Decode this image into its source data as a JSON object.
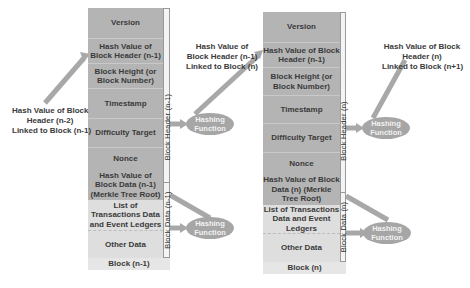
{
  "blocks": [
    {
      "id": "n-1",
      "label": "Block (n-1)",
      "header_strip_label": "Block Header (n-1)",
      "data_strip_label": "Block Data (n-1)",
      "header_fields": [
        "Version",
        "Hash Value of Block Header (n-1)",
        "Block Height (or Block Number)",
        "Timestamp",
        "Difficulty Target",
        "Nonce",
        "Hash Value of Block Data (n-1) (Merkle Tree Root)"
      ],
      "data_fields": [
        "List of Transactions Data and Event Ledgers",
        "Other Data"
      ]
    },
    {
      "id": "n",
      "label": "Block (n)",
      "header_strip_label": "Block Header (n)",
      "data_strip_label": "Block Data (n)",
      "header_fields": [
        "Version",
        "Hash Value of Block Header (n-1)",
        "Block Height (or Block Number)",
        "Timestamp",
        "Difficulty Target",
        "Nonce",
        "Hash Value of Block Data (n) (Merkle Tree Root)"
      ],
      "data_fields": [
        "List of Transactions Data and Event Ledgers",
        "Other Data"
      ]
    }
  ],
  "notes": {
    "prev_link": [
      "Hash Value of Block",
      "Header (n-2)",
      "Linked to Block (n-1)"
    ],
    "mid_link": [
      "Hash Value of",
      "Block Header (n-1)",
      "Linked to Block (n)"
    ],
    "next_link": [
      "Hash Value of Block",
      "Header (n)",
      "Linked to Block (n+1)"
    ]
  },
  "hashing_function": [
    "Hashing",
    "Function"
  ],
  "colors": {
    "header_fill": "#b4b4b4",
    "data_fill": "#dedede",
    "arrow": "#a8a8a8",
    "hash_fn_fill": "#a6a6a6"
  }
}
